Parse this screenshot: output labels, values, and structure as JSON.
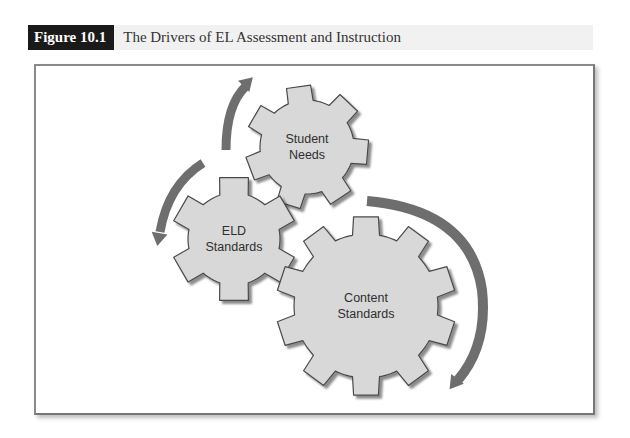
{
  "figure": {
    "label": "Figure 10.1",
    "title": "The Drivers of EL Assessment and Instruction"
  },
  "colors": {
    "gear_fill": "#d8d8d8",
    "gear_stroke": "#4a4a4a",
    "arrow": "#6e6e6e",
    "text": "#2f2f2f"
  },
  "gears": [
    {
      "id": "student-needs",
      "lines": [
        "Student",
        "Needs"
      ],
      "cx": 307,
      "cy": 147,
      "r_outer": 62,
      "r_inner": 47,
      "teeth": 7,
      "rotation": -8
    },
    {
      "id": "eld-standards",
      "lines": [
        "ELD",
        "Standards"
      ],
      "cx": 234,
      "cy": 239,
      "r_outer": 63,
      "r_inner": 46,
      "teeth": 6,
      "rotation": 0
    },
    {
      "id": "content-standards",
      "lines": [
        "Content",
        "Standards"
      ],
      "cx": 366,
      "cy": 306,
      "r_outer": 90,
      "r_inner": 72,
      "teeth": 10,
      "rotation": 0
    }
  ],
  "arrows": [
    {
      "id": "arrow-to-student-needs",
      "path": "M 226 150 Q 226 105 246 86",
      "head": [
        250,
        80
      ],
      "angle": -45
    },
    {
      "id": "arrow-to-eld-standards",
      "path": "M 203 163 Q 168 185 160 232",
      "head": [
        158,
        242
      ],
      "angle": 100
    },
    {
      "id": "arrow-to-content-standards",
      "path": "M 367 201 Q 470 210 482 290 Q 488 345 458 380",
      "head": [
        452,
        386
      ],
      "angle": 128
    }
  ]
}
